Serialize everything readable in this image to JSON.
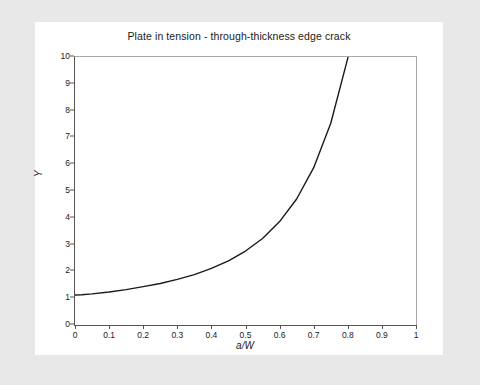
{
  "figure": {
    "title": "Plate in tension - through-thickness edge crack",
    "background_color": "#e8e8e8",
    "card_color": "#ffffff"
  },
  "chart_data": {
    "type": "line",
    "title": "Plate in tension - through-thickness edge crack",
    "xlabel": "a/W",
    "ylabel": "Y",
    "xlim": [
      0,
      1
    ],
    "ylim": [
      0,
      10
    ],
    "grid": false,
    "legend": null,
    "line_color": "#1a1a1a",
    "line_width": 1.4,
    "x_ticks": [
      "0",
      "0.1",
      "0.2",
      "0.3",
      "0.4",
      "0.5",
      "0.6",
      "0.7",
      "0.8",
      "0.9",
      "1"
    ],
    "x_tick_values": [
      0,
      0.1,
      0.2,
      0.3,
      0.4,
      0.5,
      0.6,
      0.7,
      0.8,
      0.9,
      1
    ],
    "y_ticks": [
      "0",
      "1",
      "2",
      "3",
      "4",
      "5",
      "6",
      "7",
      "8",
      "9",
      "10"
    ],
    "y_tick_values": [
      0,
      1,
      2,
      3,
      4,
      5,
      6,
      7,
      8,
      9,
      10
    ],
    "series": [
      {
        "name": "Y(a/W)",
        "x": [
          0.0,
          0.02,
          0.05,
          0.1,
          0.15,
          0.2,
          0.25,
          0.3,
          0.35,
          0.4,
          0.45,
          0.5,
          0.55,
          0.6,
          0.65,
          0.7,
          0.75,
          0.8,
          0.82,
          0.84,
          0.85
        ],
        "y": [
          1.12,
          1.13,
          1.16,
          1.23,
          1.32,
          1.43,
          1.55,
          1.7,
          1.88,
          2.11,
          2.39,
          2.76,
          3.23,
          3.86,
          4.7,
          5.87,
          7.53,
          9.96,
          11.2,
          12.7,
          13.6
        ]
      }
    ]
  }
}
